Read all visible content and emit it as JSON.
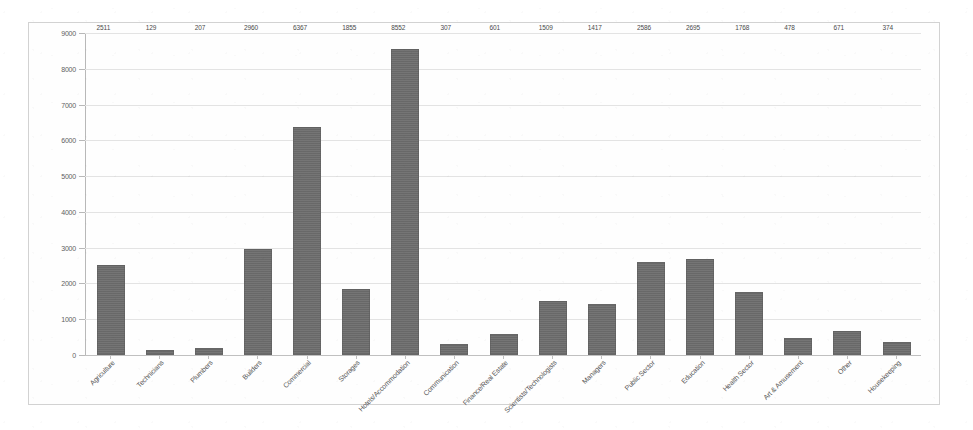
{
  "chart_data": {
    "type": "bar",
    "title": "",
    "subtitle": "",
    "xlabel": "",
    "ylabel": "",
    "ylim": [
      0,
      9000
    ],
    "ytick_step": 1000,
    "yticks": [
      "0",
      "1000",
      "2000",
      "3000",
      "4000",
      "5000",
      "6000",
      "7000",
      "8000",
      "9000"
    ],
    "grid": true,
    "legend": false,
    "legend_position": "none",
    "bar_color": "#6e6e6e",
    "gridline_color": "#e3e3e3",
    "axis_color": "#b8b8b8",
    "value_labels_shown": true,
    "categories": [
      "Agriculture",
      "Technicians",
      "Plumbers",
      "Builders",
      "Commercial",
      "Storages",
      "Hotels/Accommodation",
      "Communication",
      "Finance/Real Estate",
      "Scientists/Technologists",
      "Managers",
      "Public Sector",
      "Education",
      "Health Sector",
      "Art & Amusement",
      "Other",
      "Housekeeping"
    ],
    "values": [
      2511,
      129,
      207,
      2960,
      6367,
      1855,
      8552,
      307,
      601,
      1509,
      1417,
      2586,
      2695,
      1768,
      478,
      671,
      374
    ],
    "value_labels": [
      "2511",
      "129",
      "207",
      "2960",
      "6367",
      "1855",
      "8552",
      "307",
      "601",
      "1509",
      "1417",
      "2586",
      "2695",
      "1768",
      "478",
      "671",
      "374"
    ]
  }
}
